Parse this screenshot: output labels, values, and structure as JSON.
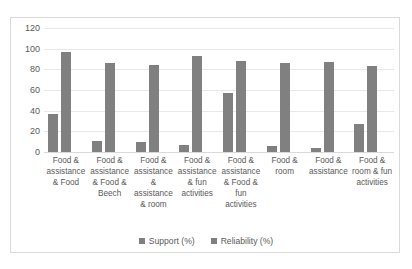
{
  "chart_data": {
    "type": "bar",
    "title": "",
    "subtitle": "",
    "xlabel": "",
    "ylabel": "",
    "ylim": [
      0,
      120
    ],
    "yticks": [
      0,
      20,
      40,
      60,
      80,
      100,
      120
    ],
    "ytick_labels": [
      "0",
      "20",
      "40",
      "60",
      "80",
      "100",
      "120"
    ],
    "grid": true,
    "legend_position": "bottom-center",
    "bar_color": "#808080",
    "categories": [
      "Food & assistance & Food",
      "Food & assistance & Food & Beech",
      "Food & assistance & assistance & room",
      "Food & assistance & fun activities",
      "Food & assistance & Food & fun activities",
      "Food & room",
      "Food & assistance",
      "Food & room & fun activities"
    ],
    "series": [
      {
        "name": "Support (%)",
        "color": "#808080",
        "values": [
          37,
          11,
          10,
          7,
          57,
          6,
          4,
          27
        ]
      },
      {
        "name": "Reliability (%)",
        "color": "#808080",
        "values": [
          97,
          86,
          84,
          93,
          88,
          86,
          87,
          83
        ]
      }
    ]
  },
  "legend": {
    "items": [
      {
        "label": "Support (%)"
      },
      {
        "label": "Reliability (%)"
      }
    ]
  }
}
